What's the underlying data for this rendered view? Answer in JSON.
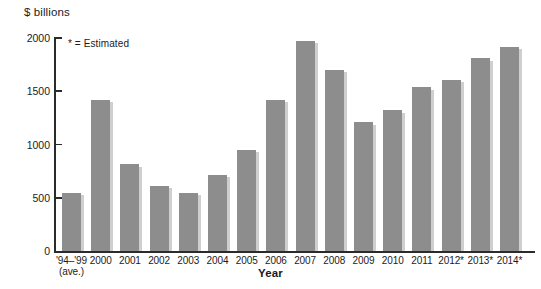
{
  "chart_data": {
    "type": "bar",
    "title": "",
    "subtitle": "",
    "xlabel": "Year",
    "ylabel": "$ billions",
    "ylim": [
      0,
      2000
    ],
    "ytick_values": [
      0,
      500,
      1000,
      1500,
      2000
    ],
    "ytick_labels": [
      "0",
      "500",
      "1000",
      "1500",
      "2000"
    ],
    "grid": false,
    "legend": null,
    "annotations": [
      "* = Estimated"
    ],
    "bar_color": "#8d8d8d",
    "categories": [
      "'94–'99 (ave.)",
      "2000",
      "2001",
      "2002",
      "2003",
      "2004",
      "2005",
      "2006",
      "2007",
      "2008",
      "2009",
      "2010",
      "2011",
      "2012*",
      "2013*",
      "2014*"
    ],
    "category_lines": [
      [
        "'94–'99",
        "(ave.)"
      ],
      [
        "2000",
        ""
      ],
      [
        "2001",
        ""
      ],
      [
        "2002",
        ""
      ],
      [
        "2003",
        ""
      ],
      [
        "2004",
        ""
      ],
      [
        "2005",
        ""
      ],
      [
        "2006",
        ""
      ],
      [
        "2007",
        ""
      ],
      [
        "2008",
        ""
      ],
      [
        "2009",
        ""
      ],
      [
        "2010",
        ""
      ],
      [
        "2011",
        ""
      ],
      [
        "2012*",
        ""
      ],
      [
        "2013*",
        ""
      ],
      [
        "2014*",
        ""
      ]
    ],
    "values": [
      545,
      1420,
      815,
      615,
      545,
      715,
      950,
      1420,
      1975,
      1700,
      1210,
      1320,
      1540,
      1610,
      1810,
      1920
    ]
  }
}
